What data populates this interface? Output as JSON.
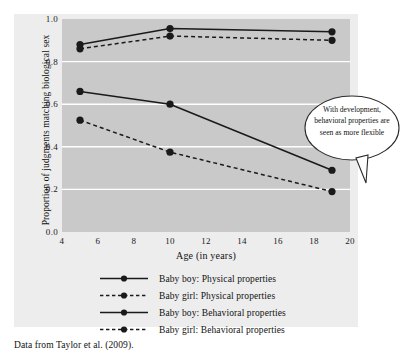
{
  "caption": "Data from Taylor et al. (2009).",
  "annotation": {
    "text": "With development, behavioral properties are seen as more flexible"
  },
  "axes": {
    "ylabel": "Proportion of judgments matching biological sex",
    "xlabel": "Age (in years)",
    "yticks": [
      "1.0",
      "0.8",
      "0.6",
      "0.4",
      "0.2",
      "0.0"
    ],
    "xticks": [
      "4",
      "6",
      "8",
      "10",
      "12",
      "14",
      "16",
      "18",
      "20"
    ]
  },
  "colors": {
    "line": "#1a1a1a",
    "marker": "#1a1a1a",
    "panel": "#c9c9c9",
    "figure_background": "#ededed",
    "gridline": "#ffffff"
  },
  "legend": [
    {
      "label": "Baby boy: Physical properties",
      "style": "solid"
    },
    {
      "label": "Baby girl: Physical properties",
      "style": "dashed"
    },
    {
      "label": "Baby boy: Behavioral properties",
      "style": "solid"
    },
    {
      "label": "Baby girl: Behavioral properties",
      "style": "dashed"
    }
  ],
  "chart_data": {
    "type": "line",
    "title": "",
    "xlabel": "Age (in years)",
    "ylabel": "Proportion of judgments matching biological sex",
    "xlim": [
      4,
      20
    ],
    "ylim": [
      0.0,
      1.0
    ],
    "xticks": [
      4,
      6,
      8,
      10,
      12,
      14,
      16,
      18,
      20
    ],
    "yticks": [
      0.0,
      0.2,
      0.4,
      0.6,
      0.8,
      1.0
    ],
    "grid": "horizontal",
    "legend_position": "below",
    "x": [
      5,
      10,
      19
    ],
    "series": [
      {
        "name": "Baby boy: Physical properties",
        "style": "solid",
        "values": [
          0.88,
          0.955,
          0.94
        ]
      },
      {
        "name": "Baby girl: Physical properties",
        "style": "dashed",
        "values": [
          0.86,
          0.92,
          0.9
        ]
      },
      {
        "name": "Baby boy: Behavioral properties",
        "style": "solid",
        "values": [
          0.66,
          0.6,
          0.29
        ]
      },
      {
        "name": "Baby girl: Behavioral properties",
        "style": "dashed",
        "values": [
          0.525,
          0.375,
          0.19
        ]
      }
    ],
    "annotations": [
      {
        "text": "With development, behavioral properties are seen as more flexible",
        "points_to": {
          "x": 19,
          "y": 0.29
        }
      }
    ]
  }
}
